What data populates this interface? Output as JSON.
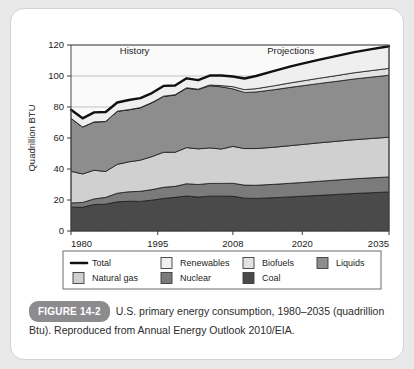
{
  "figure": {
    "badge": "FIGURE 14-2",
    "caption": "U.S. primary energy consumption, 1980–2035 (quadrillion Btu). Reproduced from Annual Energy Outlook 2010/EIA."
  },
  "legend": {
    "items": [
      {
        "label": "Total",
        "swatch": "line",
        "color": "#111111"
      },
      {
        "label": "Renewables",
        "swatch": "square",
        "color": "#efefef"
      },
      {
        "label": "Biofuels",
        "swatch": "square",
        "color": "#e2e2e2"
      },
      {
        "label": "Liquids",
        "swatch": "square",
        "color": "#8d8d8d"
      },
      {
        "label": "Natural gas",
        "swatch": "square",
        "color": "#d0d0d0"
      },
      {
        "label": "Nuclear",
        "swatch": "square",
        "color": "#7b7b7b"
      },
      {
        "label": "Coal",
        "swatch": "square",
        "color": "#4a4a4a"
      }
    ]
  },
  "chart_data": {
    "type": "area",
    "stacked": true,
    "title": "",
    "xlabel": "",
    "ylabel": "Quadrillion BTU",
    "xlim": [
      1980,
      2035
    ],
    "ylim": [
      0,
      120
    ],
    "yticks": [
      0,
      20,
      40,
      60,
      80,
      100,
      120
    ],
    "xticks": [
      1980,
      1995,
      2008,
      2020,
      2035
    ],
    "xticklabels": [
      "1980",
      "1995",
      "2008",
      "2020",
      "2035"
    ],
    "grid": true,
    "legend_position": "below",
    "annotations": [
      {
        "text": "History",
        "x": 1991,
        "y": 114
      },
      {
        "text": "Projections",
        "x": 2018,
        "y": 114
      }
    ],
    "history_end": 2008,
    "x": [
      1980,
      1982,
      1984,
      1986,
      1988,
      1990,
      1992,
      1994,
      1996,
      1998,
      2000,
      2002,
      2004,
      2006,
      2008,
      2010,
      2012,
      2015,
      2018,
      2020,
      2023,
      2026,
      2029,
      2032,
      2035
    ],
    "series": [
      {
        "name": "Coal",
        "color": "#4a4a4a",
        "values": [
          15.4,
          15.3,
          17.1,
          17.3,
          18.8,
          19.2,
          19.1,
          19.9,
          21.0,
          21.7,
          22.6,
          21.9,
          22.5,
          22.5,
          22.4,
          21.2,
          21.0,
          21.5,
          22.0,
          22.4,
          23.0,
          23.6,
          24.2,
          24.7,
          25.2
        ]
      },
      {
        "name": "Nuclear",
        "color": "#7b7b7b",
        "values": [
          2.7,
          3.1,
          3.6,
          4.4,
          5.6,
          6.1,
          6.5,
          6.8,
          7.2,
          7.1,
          7.9,
          8.1,
          8.2,
          8.2,
          8.4,
          8.4,
          8.5,
          8.6,
          8.8,
          8.9,
          9.1,
          9.3,
          9.5,
          9.6,
          9.7
        ]
      },
      {
        "name": "Natural gas",
        "color": "#d0d0d0",
        "values": [
          20.4,
          18.4,
          18.5,
          16.7,
          18.6,
          19.3,
          20.1,
          21.3,
          22.6,
          22.0,
          23.3,
          23.0,
          22.9,
          22.2,
          23.8,
          23.6,
          23.7,
          23.9,
          24.3,
          24.5,
          24.8,
          25.0,
          25.2,
          25.4,
          25.6
        ]
      },
      {
        "name": "Liquids",
        "color": "#8d8d8d",
        "values": [
          34.2,
          30.3,
          31.1,
          32.2,
          34.2,
          33.6,
          33.8,
          34.7,
          36.0,
          36.9,
          38.3,
          38.2,
          40.1,
          40.1,
          37.1,
          36.2,
          36.5,
          37.1,
          37.6,
          37.9,
          38.3,
          38.7,
          39.2,
          39.6,
          40.0
        ]
      },
      {
        "name": "Biofuels",
        "color": "#e2e2e2",
        "values": [
          0.0,
          0.0,
          0.1,
          0.1,
          0.1,
          0.1,
          0.1,
          0.2,
          0.2,
          0.2,
          0.3,
          0.3,
          0.5,
          0.8,
          1.4,
          1.8,
          2.1,
          2.5,
          2.9,
          3.1,
          3.4,
          3.7,
          4.0,
          4.2,
          4.4
        ]
      },
      {
        "name": "Renewables",
        "color": "#efefef",
        "values": [
          5.5,
          5.6,
          6.1,
          6.1,
          5.6,
          6.2,
          6.1,
          6.1,
          6.6,
          6.0,
          6.1,
          5.8,
          6.1,
          6.5,
          6.6,
          7.2,
          8.2,
          9.6,
          10.6,
          11.2,
          12.0,
          12.7,
          13.3,
          13.8,
          14.3
        ]
      }
    ],
    "total": {
      "name": "Total",
      "color": "#111111",
      "values": [
        78.2,
        72.7,
        76.5,
        76.8,
        82.9,
        84.5,
        85.7,
        89.0,
        93.6,
        93.9,
        98.5,
        97.3,
        100.3,
        100.3,
        99.7,
        98.4,
        100.0,
        103.2,
        106.2,
        108.0,
        110.6,
        113.0,
        115.4,
        117.3,
        119.2
      ]
    }
  }
}
